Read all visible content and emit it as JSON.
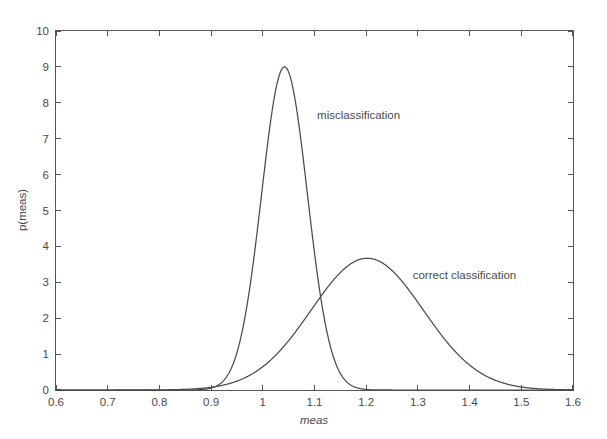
{
  "chart_data": {
    "type": "line",
    "title": "",
    "xlabel": "meas",
    "ylabel": "p(meas)",
    "xlim": [
      0.6,
      1.6
    ],
    "ylim": [
      0,
      10
    ],
    "grid": false,
    "legend_position": "inline-annotations",
    "x_ticks": [
      "0.6",
      "0.7",
      "0.8",
      "0.9",
      "1",
      "1.1",
      "1.2",
      "1.3",
      "1.4",
      "1.5",
      "1.6"
    ],
    "x_tick_values": [
      0.6,
      0.7,
      0.8,
      0.9,
      1.0,
      1.1,
      1.2,
      1.3,
      1.4,
      1.5,
      1.6
    ],
    "y_ticks": [
      "0",
      "1",
      "2",
      "3",
      "4",
      "5",
      "6",
      "7",
      "8",
      "9",
      "10"
    ],
    "y_tick_values": [
      0,
      1,
      2,
      3,
      4,
      5,
      6,
      7,
      8,
      9,
      10
    ],
    "annotations": [
      {
        "text": "misclassification",
        "x": 1.105,
        "y": 7.55
      },
      {
        "text": "correct classification",
        "x": 1.29,
        "y": 3.08
      }
    ],
    "series": [
      {
        "name": "misclassification",
        "distribution": "gaussian",
        "mean": 1.042,
        "sigma": 0.0443,
        "peak_value": 9.0,
        "peak_x": 1.042,
        "x": [
          0.6,
          0.7,
          0.8,
          0.85,
          0.88,
          0.9,
          0.92,
          0.94,
          0.95,
          0.96,
          0.97,
          0.98,
          0.99,
          1.0,
          1.01,
          1.02,
          1.03,
          1.04,
          1.042,
          1.05,
          1.06,
          1.07,
          1.08,
          1.09,
          1.1,
          1.11,
          1.12,
          1.13,
          1.14,
          1.15,
          1.16,
          1.18,
          1.2,
          1.3,
          1.4,
          1.5,
          1.6
        ],
        "y": [
          0.0,
          0.0,
          0.0,
          0.01,
          0.04,
          0.12,
          0.32,
          0.76,
          1.14,
          1.64,
          2.27,
          3.04,
          3.91,
          4.85,
          5.8,
          6.68,
          7.43,
          8.0,
          9.0,
          8.9,
          8.52,
          7.9,
          7.1,
          6.18,
          5.2,
          4.23,
          3.32,
          2.52,
          1.84,
          1.3,
          0.89,
          0.37,
          0.13,
          0.0,
          0.0,
          0.0,
          0.0
        ]
      },
      {
        "name": "correct classification",
        "distribution": "gaussian",
        "mean": 1.202,
        "sigma": 0.1085,
        "peak_value": 3.67,
        "peak_x": 1.202,
        "x": [
          0.6,
          0.7,
          0.8,
          0.85,
          0.88,
          0.9,
          0.92,
          0.95,
          0.98,
          1.0,
          1.02,
          1.05,
          1.08,
          1.1,
          1.12,
          1.15,
          1.18,
          1.2,
          1.202,
          1.22,
          1.25,
          1.28,
          1.3,
          1.32,
          1.35,
          1.38,
          1.4,
          1.42,
          1.45,
          1.48,
          1.5,
          1.52,
          1.55,
          1.58,
          1.6
        ],
        "y": [
          0.0,
          0.0,
          0.01,
          0.03,
          0.06,
          0.1,
          0.16,
          0.32,
          0.58,
          0.82,
          1.12,
          1.65,
          2.25,
          2.65,
          3.02,
          3.45,
          3.64,
          3.67,
          3.67,
          3.65,
          3.49,
          3.21,
          2.97,
          2.7,
          2.25,
          1.79,
          1.49,
          1.21,
          0.85,
          0.57,
          0.42,
          0.3,
          0.17,
          0.09,
          0.06
        ]
      }
    ]
  }
}
